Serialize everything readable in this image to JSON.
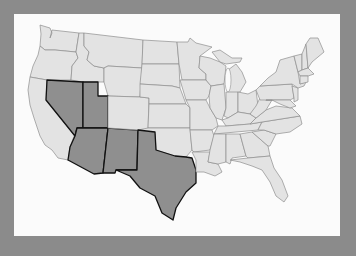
{
  "map": {
    "subject": "United States (contiguous 48 states)",
    "highlighted_states": [
      "Nevada",
      "Utah",
      "Arizona",
      "New Mexico",
      "Texas"
    ],
    "colors": {
      "background": "#8b8b8b",
      "panel": "#fbfbfb",
      "state_fill": "#e3e3e3",
      "state_border": "#8e8e8e",
      "highlight_fill": "#8f8f8f",
      "highlight_border": "#111111"
    }
  }
}
